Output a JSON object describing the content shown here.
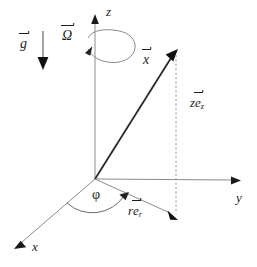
{
  "figure": {
    "background_color": "#ffffff",
    "axis_color": "#8c8c8c",
    "vector_color": "#2b2b2b",
    "label_color": "#1d1d1d"
  },
  "labels": {
    "z_axis": "z",
    "y_axis": "y",
    "x_axis": "x",
    "gravity": "g",
    "omega": "Ω",
    "position_vector": "x",
    "z_component_main": "z",
    "z_component_unit": "e",
    "z_component_sub": "z",
    "r_component_main": "r",
    "r_component_unit": "e",
    "r_component_sub": "r",
    "azimuth_angle": "φ"
  },
  "geometry": {
    "origin": {
      "x": 95,
      "y": 179
    },
    "z_axis_tip": {
      "x": 95,
      "y": 16
    },
    "y_axis_tip": {
      "x": 240,
      "y": 180
    },
    "x_axis_tip": {
      "x": 15,
      "y": 246
    },
    "position_vector_tip": {
      "x": 177,
      "y": 52
    },
    "projection_point": {
      "x": 176,
      "y": 219
    },
    "gravity_arrow": {
      "x": 43,
      "y_start": 31,
      "y_end": 69
    },
    "omega_loop": {
      "cx": 111,
      "cy": 46,
      "rx": 24,
      "ry": 17
    },
    "phi_arc_radius": 38
  }
}
